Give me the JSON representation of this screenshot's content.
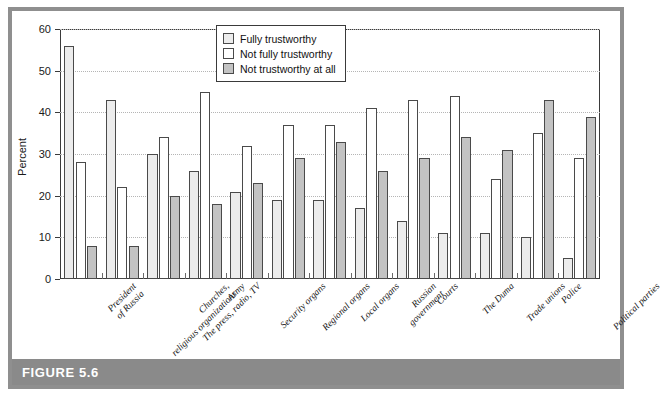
{
  "figure": {
    "caption": "FIGURE 5.6",
    "frame_color": "#8f8f8f",
    "caption_bar_color": "#8a8a8a"
  },
  "chart_data": {
    "type": "bar",
    "title": "",
    "xlabel": "",
    "ylabel": "Percent",
    "ylim": [
      0,
      60
    ],
    "yticks": [
      0,
      10,
      20,
      30,
      40,
      50,
      60
    ],
    "grid": true,
    "legend_position": "top-center",
    "categories": [
      "President\nof Russia",
      "Churches,\nreligious organizations",
      "The press, radio, TV",
      "Army",
      "Security organs",
      "Regional organs",
      "Local organs",
      "Russian\ngovernment",
      "Courts",
      "The Duma",
      "Trade unions",
      "Police",
      "Political parties"
    ],
    "series": [
      {
        "name": "Fully trustworthy",
        "color": "#ececec",
        "values": [
          56,
          43,
          30,
          26,
          21,
          19,
          19,
          17,
          14,
          11,
          11,
          10,
          5
        ]
      },
      {
        "name": "Not fully trustworthy",
        "color": "#ffffff",
        "values": [
          28,
          22,
          34,
          45,
          32,
          37,
          37,
          41,
          43,
          44,
          24,
          35,
          29
        ]
      },
      {
        "name": "Not trustworthy at all",
        "color": "#c3c3c3",
        "values": [
          8,
          8,
          20,
          18,
          23,
          29,
          33,
          26,
          29,
          34,
          31,
          43,
          39
        ]
      }
    ]
  },
  "legend": {
    "entries": [
      {
        "label": "Fully trustworthy",
        "color": "#ececec"
      },
      {
        "label": "Not fully trustworthy",
        "color": "#ffffff"
      },
      {
        "label": "Not trustworthy at all",
        "color": "#c3c3c3"
      }
    ]
  }
}
